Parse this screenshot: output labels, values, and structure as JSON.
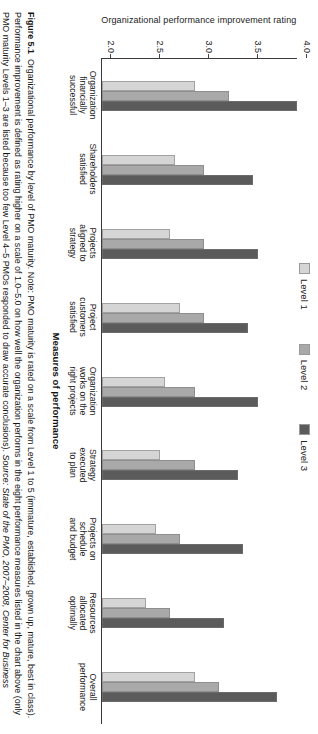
{
  "figure": {
    "number": "Figure 5.1",
    "caption_main": "Organizational performance by level of PMO maturity.",
    "caption_note": "Note: PMO maturity is rated on a scale from Level 1 to 5 (immature, established, grown up, mature, best in class). Performance improvement is defined as rating higher on a scale of 1.0–5.0 on how well the organization performs in the eight performance measures listed in the chart above (only PMO maturity Levels 1–3 are listed because too few Level 4–5 PMOs responded to draw accurate conclusions).",
    "source_label": "Source:",
    "source_text": "State of the PMO, 2007–2008, Center for Business Practices Research"
  },
  "legend": {
    "items": [
      {
        "label": "Level 1",
        "color": "#d5d5d5"
      },
      {
        "label": "Level 2",
        "color": "#a9a9a9"
      },
      {
        "label": "Level 3",
        "color": "#5b5b5b"
      }
    ]
  },
  "chart_data": {
    "type": "bar",
    "title": "",
    "xlabel": "Measures of performance",
    "ylabel": "Organizational performance improvement rating",
    "ylim": [
      2.0,
      4.0
    ],
    "yticks": [
      "2.0",
      "2.5",
      "3.0",
      "3.5",
      "4.0"
    ],
    "grid": false,
    "legend_position": "top",
    "categories": [
      "Organization financially successful",
      "Shareholders satisfied",
      "Projects aligned to strategy",
      "Project customers satisfied",
      "Organization works on the right projects",
      "Strategy executed to plan",
      "Projects on schedule and budget",
      "Resources allocated optimally",
      "Overall performance"
    ],
    "category_lines": [
      [
        "Organization",
        "financially",
        "successful"
      ],
      [
        "Shareholders",
        "satisfied"
      ],
      [
        "Projects",
        "aligned to",
        "strategy"
      ],
      [
        "Project",
        "customers",
        "satisfied"
      ],
      [
        "Organization",
        "works on the",
        "right projects"
      ],
      [
        "Strategy",
        "executed",
        "to plan"
      ],
      [
        "Projects on",
        "schedule",
        "and budget"
      ],
      [
        "Resources",
        "allocated",
        "optimally"
      ],
      [
        "Overall",
        "performance"
      ]
    ],
    "series": [
      {
        "name": "Level 1",
        "color": "#d5d5d5",
        "values": [
          2.95,
          2.75,
          2.7,
          2.8,
          2.65,
          2.6,
          2.55,
          2.45,
          2.95
        ]
      },
      {
        "name": "Level 2",
        "color": "#a9a9a9",
        "values": [
          3.3,
          3.05,
          3.05,
          3.05,
          2.95,
          2.95,
          2.8,
          2.7,
          3.2
        ]
      },
      {
        "name": "Level 3",
        "color": "#5b5b5b",
        "values": [
          4.0,
          3.55,
          3.6,
          3.5,
          3.6,
          3.4,
          3.45,
          3.25,
          3.8
        ]
      }
    ]
  }
}
